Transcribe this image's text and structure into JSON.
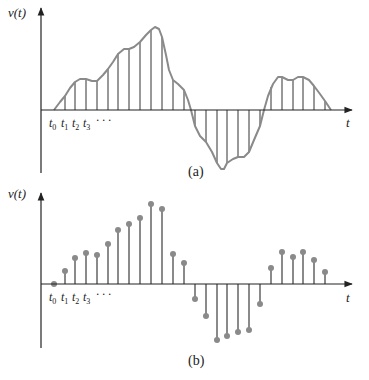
{
  "colors": {
    "axis": "#222222",
    "curve": "#8a8a8a",
    "stem": "#333333",
    "marker": "#8a8a8a",
    "background": "#ffffff"
  },
  "panel_a": {
    "caption": "(a)",
    "ylabel": "v(t)",
    "xlabel": "t",
    "tick_labels": [
      "t0",
      "t1",
      "t2",
      "t3",
      "· · ·"
    ],
    "axis": {
      "x": 41,
      "y_top": 8,
      "y_bottom": 173,
      "baseline": 110,
      "x_end": 352
    },
    "curve_points": [
      [
        54,
        110
      ],
      [
        60,
        102
      ],
      [
        65,
        96
      ],
      [
        70,
        88
      ],
      [
        75,
        82
      ],
      [
        80,
        79
      ],
      [
        86,
        79
      ],
      [
        92,
        81
      ],
      [
        97,
        81
      ],
      [
        103,
        75
      ],
      [
        108,
        69
      ],
      [
        113,
        62
      ],
      [
        118,
        54
      ],
      [
        124,
        49
      ],
      [
        129,
        49
      ],
      [
        134,
        47
      ],
      [
        140,
        42
      ],
      [
        146,
        35
      ],
      [
        151,
        30
      ],
      [
        155,
        27
      ],
      [
        159,
        29
      ],
      [
        162,
        37
      ],
      [
        166,
        55
      ],
      [
        169,
        70
      ],
      [
        173,
        80
      ],
      [
        178,
        84
      ],
      [
        184,
        90
      ],
      [
        188,
        100
      ],
      [
        191,
        110
      ],
      [
        195,
        126
      ],
      [
        200,
        136
      ],
      [
        206,
        142
      ],
      [
        212,
        152
      ],
      [
        217,
        163
      ],
      [
        221,
        169
      ],
      [
        224,
        169
      ],
      [
        227,
        163
      ],
      [
        233,
        159
      ],
      [
        238,
        157
      ],
      [
        244,
        157
      ],
      [
        249,
        152
      ],
      [
        254,
        140
      ],
      [
        260,
        126
      ],
      [
        264,
        110
      ],
      [
        268,
        96
      ],
      [
        273,
        84
      ],
      [
        278,
        77
      ],
      [
        282,
        77
      ],
      [
        288,
        80
      ],
      [
        293,
        80
      ],
      [
        298,
        77
      ],
      [
        303,
        77
      ],
      [
        309,
        80
      ],
      [
        314,
        86
      ],
      [
        320,
        94
      ],
      [
        325,
        101
      ],
      [
        331,
        110
      ]
    ],
    "samples": [
      {
        "x": 54,
        "y": 110
      },
      {
        "x": 65,
        "y": 96
      },
      {
        "x": 75,
        "y": 82
      },
      {
        "x": 86,
        "y": 79
      },
      {
        "x": 97,
        "y": 81
      },
      {
        "x": 108,
        "y": 69
      },
      {
        "x": 118,
        "y": 54
      },
      {
        "x": 129,
        "y": 49
      },
      {
        "x": 140,
        "y": 42
      },
      {
        "x": 151,
        "y": 30
      },
      {
        "x": 162,
        "y": 37
      },
      {
        "x": 173,
        "y": 80
      },
      {
        "x": 184,
        "y": 90
      },
      {
        "x": 195,
        "y": 126
      },
      {
        "x": 206,
        "y": 142
      },
      {
        "x": 217,
        "y": 163
      },
      {
        "x": 227,
        "y": 163
      },
      {
        "x": 238,
        "y": 157
      },
      {
        "x": 249,
        "y": 152
      },
      {
        "x": 260,
        "y": 126
      },
      {
        "x": 271,
        "y": 87
      },
      {
        "x": 282,
        "y": 77
      },
      {
        "x": 293,
        "y": 80
      },
      {
        "x": 303,
        "y": 77
      },
      {
        "x": 314,
        "y": 86
      },
      {
        "x": 325,
        "y": 101
      }
    ]
  },
  "panel_b": {
    "caption": "(b)",
    "ylabel": "v(t)",
    "xlabel": "t",
    "tick_labels": [
      "t0",
      "t1",
      "t2",
      "t3",
      "· · ·"
    ],
    "axis": {
      "x": 41,
      "y_top": 193,
      "y_bottom": 348,
      "baseline": 284,
      "x_end": 352
    },
    "samples": [
      {
        "x": 54,
        "y": 284
      },
      {
        "x": 65,
        "y": 271
      },
      {
        "x": 75,
        "y": 258
      },
      {
        "x": 86,
        "y": 253
      },
      {
        "x": 97,
        "y": 255
      },
      {
        "x": 108,
        "y": 244
      },
      {
        "x": 118,
        "y": 230
      },
      {
        "x": 129,
        "y": 224
      },
      {
        "x": 140,
        "y": 218
      },
      {
        "x": 151,
        "y": 204
      },
      {
        "x": 162,
        "y": 209
      },
      {
        "x": 173,
        "y": 254
      },
      {
        "x": 184,
        "y": 263
      },
      {
        "x": 195,
        "y": 299
      },
      {
        "x": 206,
        "y": 316
      },
      {
        "x": 217,
        "y": 340
      },
      {
        "x": 227,
        "y": 336
      },
      {
        "x": 238,
        "y": 332
      },
      {
        "x": 249,
        "y": 330
      },
      {
        "x": 260,
        "y": 304
      },
      {
        "x": 271,
        "y": 268
      },
      {
        "x": 282,
        "y": 252
      },
      {
        "x": 293,
        "y": 257
      },
      {
        "x": 303,
        "y": 252
      },
      {
        "x": 314,
        "y": 260
      },
      {
        "x": 325,
        "y": 272
      }
    ]
  }
}
